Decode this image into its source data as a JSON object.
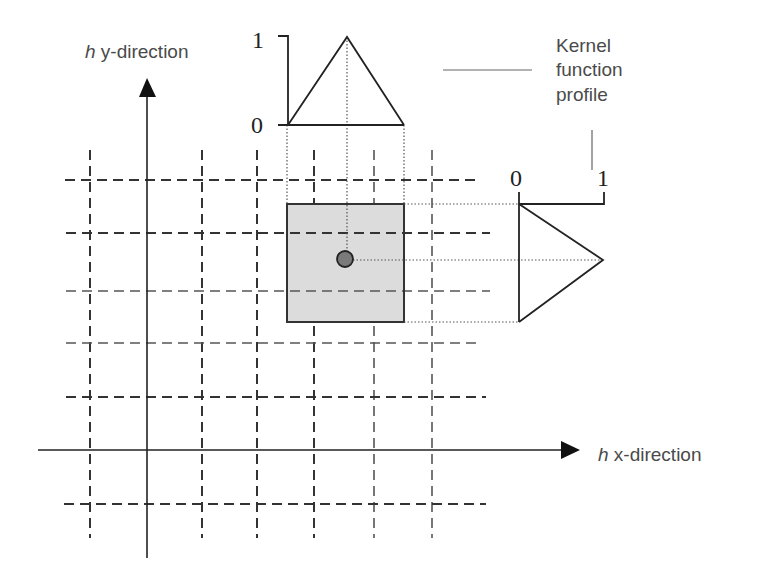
{
  "diagram": {
    "axes": {
      "y_label_italic": "h",
      "y_label_rest": " y-direction",
      "x_label_italic": "h",
      "x_label_rest": " x-direction"
    },
    "top_kernel": {
      "label_max": "1",
      "label_min": "0"
    },
    "side_kernel": {
      "label_min": "0",
      "label_max": "1"
    },
    "annotation": {
      "line1": "Kernel",
      "line2": "function",
      "line3": "profile"
    },
    "colors": {
      "cell_fill": "#dcdcdc",
      "cell_stroke": "#333333",
      "center_point_fill": "#7a7a7a",
      "line_color": "#222222",
      "text_color": "#4a4a4a"
    },
    "grid": {
      "vertical_x": [
        90,
        202,
        257,
        314,
        374,
        432
      ],
      "horizontal_y": [
        180,
        233,
        291,
        343,
        397,
        504
      ]
    }
  }
}
